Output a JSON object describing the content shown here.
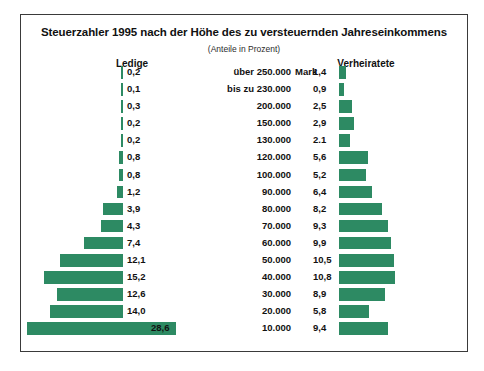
{
  "chart_data": {
    "type": "bar",
    "subtype": "butterfly",
    "title": "Steuerzahler 1995 nach der Höhe des zu versteuernden Jahreseinkommens",
    "subtitle": "(Anteile in Prozent)",
    "unit_label": "Mark",
    "xlabel": "",
    "ylabel": "",
    "grid": false,
    "legend_position": "top",
    "series": [
      {
        "name": "Ledige",
        "values": [
          0.2,
          0.1,
          0.3,
          0.2,
          0.2,
          0.8,
          0.8,
          1.2,
          3.9,
          4.3,
          7.4,
          12.1,
          15.2,
          12.6,
          14.0,
          28.6
        ],
        "labels": [
          "0,2",
          "0,1",
          "0,3",
          "0,2",
          "0,2",
          "0,8",
          "0,8",
          "1,2",
          "3,9",
          "4,3",
          "7,4",
          "12,1",
          "15,2",
          "12,6",
          "14,0",
          "28,6"
        ]
      },
      {
        "name": "Verheiratete",
        "values": [
          1.4,
          0.9,
          2.5,
          2.9,
          2.1,
          5.6,
          5.2,
          6.4,
          8.2,
          9.3,
          9.9,
          10.5,
          10.8,
          8.9,
          5.8,
          9.4
        ],
        "labels": [
          "1,4",
          "0,9",
          "2,5",
          "2,9",
          "2.1",
          "5,6",
          "5,2",
          "6,4",
          "8,2",
          "9,3",
          "9,9",
          "10,5",
          "10,8",
          "8,9",
          "5,8",
          "9,4"
        ]
      }
    ],
    "categories": [
      "über 250.000",
      "bis zu 230.000",
      "200.000",
      "150.000",
      "130.000",
      "120.000",
      "100.000",
      "90.000",
      "80.000",
      "70.000",
      "60.000",
      "50.000",
      "40.000",
      "30.000",
      "20.000",
      "10.000"
    ],
    "bar_color": "#2d8a63",
    "xlim": [
      0,
      28.6
    ]
  },
  "header": {
    "left_group": "Ledige",
    "right_group": "Verheiratete"
  }
}
